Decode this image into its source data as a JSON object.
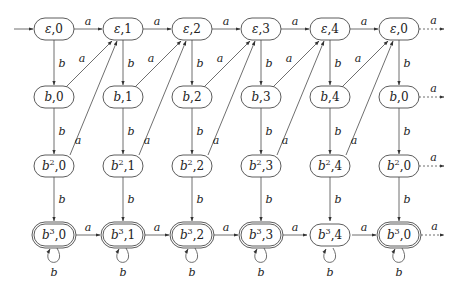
{
  "diagram": {
    "type": "finite-automaton",
    "columns": [
      0,
      1,
      2,
      3,
      4,
      0
    ],
    "rows": [
      {
        "prefix": "ε",
        "sup": ""
      },
      {
        "prefix": "b",
        "sup": ""
      },
      {
        "prefix": "b",
        "sup": "2"
      },
      {
        "prefix": "b",
        "sup": "3"
      }
    ],
    "nodes": [
      {
        "id": "e0",
        "label": "ε,0",
        "col": 0,
        "row": 0,
        "initial": true,
        "accepting": false
      },
      {
        "id": "e1",
        "label": "ε,1",
        "col": 1,
        "row": 0,
        "accepting": false
      },
      {
        "id": "e2",
        "label": "ε,2",
        "col": 2,
        "row": 0,
        "accepting": false
      },
      {
        "id": "e3",
        "label": "ε,3",
        "col": 3,
        "row": 0,
        "accepting": false
      },
      {
        "id": "e4",
        "label": "ε,4",
        "col": 4,
        "row": 0,
        "accepting": false
      },
      {
        "id": "e0b",
        "label": "ε,0",
        "col": 5,
        "row": 0,
        "accepting": false
      },
      {
        "id": "b0",
        "label": "b,0",
        "col": 0,
        "row": 1,
        "accepting": false
      },
      {
        "id": "b1",
        "label": "b,1",
        "col": 1,
        "row": 1,
        "accepting": false
      },
      {
        "id": "b2",
        "label": "b,2",
        "col": 2,
        "row": 1,
        "accepting": false
      },
      {
        "id": "b3",
        "label": "b,3",
        "col": 3,
        "row": 1,
        "accepting": false
      },
      {
        "id": "b4",
        "label": "b,4",
        "col": 4,
        "row": 1,
        "accepting": false
      },
      {
        "id": "b0b",
        "label": "b,0",
        "col": 5,
        "row": 1,
        "accepting": false
      },
      {
        "id": "bb0",
        "label": "b²,0",
        "col": 0,
        "row": 2,
        "accepting": false
      },
      {
        "id": "bb1",
        "label": "b²,1",
        "col": 1,
        "row": 2,
        "accepting": false
      },
      {
        "id": "bb2",
        "label": "b²,2",
        "col": 2,
        "row": 2,
        "accepting": false
      },
      {
        "id": "bb3",
        "label": "b²,3",
        "col": 3,
        "row": 2,
        "accepting": false
      },
      {
        "id": "bb4",
        "label": "b²,4",
        "col": 4,
        "row": 2,
        "accepting": false
      },
      {
        "id": "bb0b",
        "label": "b²,0",
        "col": 5,
        "row": 2,
        "accepting": false
      },
      {
        "id": "bbb0",
        "label": "b³,0",
        "col": 0,
        "row": 3,
        "accepting": true
      },
      {
        "id": "bbb1",
        "label": "b³,1",
        "col": 1,
        "row": 3,
        "accepting": true
      },
      {
        "id": "bbb2",
        "label": "b³,2",
        "col": 2,
        "row": 3,
        "accepting": true
      },
      {
        "id": "bbb3",
        "label": "b³,3",
        "col": 3,
        "row": 3,
        "accepting": true
      },
      {
        "id": "bbb4",
        "label": "b³,4",
        "col": 4,
        "row": 3,
        "accepting": false
      },
      {
        "id": "bbb0b",
        "label": "b³,0",
        "col": 5,
        "row": 3,
        "accepting": true
      }
    ],
    "edge_labels": {
      "horizontal": "a",
      "vertical": "b",
      "diagonal": "a",
      "self_loop": "b",
      "continuation": "a"
    },
    "continuation_rows": [
      0,
      1,
      2,
      3
    ],
    "colors": {
      "stroke": "#4a4a4a",
      "text": "#222222",
      "background": "#ffffff"
    }
  }
}
